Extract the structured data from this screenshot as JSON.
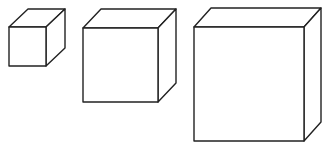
{
  "diagram": {
    "type": "cubes-increasing-size",
    "stroke_color": "#222222",
    "background": "#ffffff",
    "cubes": [
      {
        "name": "small-cube",
        "front": {
          "x": 9,
          "y": 27,
          "w": 37,
          "h": 39
        },
        "depth": {
          "dx": 19,
          "dy": -18
        }
      },
      {
        "name": "medium-cube",
        "front": {
          "x": 83,
          "y": 28,
          "w": 75,
          "h": 74
        },
        "depth": {
          "dx": 18,
          "dy": -19
        }
      },
      {
        "name": "large-cube",
        "front": {
          "x": 194,
          "y": 27,
          "w": 110,
          "h": 114
        },
        "depth": {
          "dx": 17,
          "dy": -19
        }
      }
    ]
  }
}
